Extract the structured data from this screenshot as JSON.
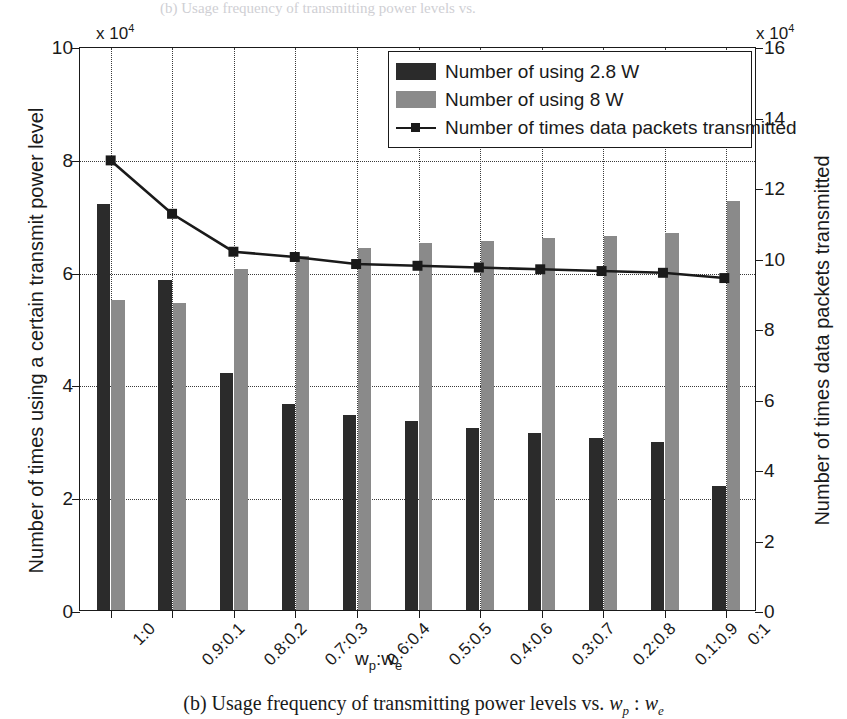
{
  "caption": {
    "prefix": "(b) Usage frequency of transmitting power levels vs. ",
    "wp": "w",
    "wp_sub": "p",
    "sep": " : ",
    "we": "w",
    "we_sub": "e"
  },
  "ghost_top_text": "(b) Usage frequency of transmitting power levels vs.",
  "axes": {
    "left": {
      "title": "Number of times using a certain transmit power level",
      "multiplier_text": "x 10",
      "multiplier_exp": "4",
      "ticks": [
        "0",
        "2",
        "4",
        "6",
        "8",
        "10"
      ],
      "tick_values": [
        0,
        2,
        4,
        6,
        8,
        10
      ],
      "min": 0,
      "max": 10
    },
    "right": {
      "title": "Number of times data packets transmitted",
      "multiplier_text": "x 10",
      "multiplier_exp": "4",
      "ticks": [
        "0",
        "2",
        "4",
        "6",
        "8",
        "10",
        "12",
        "14",
        "16"
      ],
      "tick_values": [
        0,
        2,
        4,
        6,
        8,
        10,
        12,
        14,
        16
      ],
      "min": 0,
      "max": 16
    },
    "x": {
      "title_main": "w",
      "title_sub1": "p",
      "title_colon": ":w",
      "title_sub2": "e"
    }
  },
  "legend": {
    "items": [
      {
        "label": "Number of using 2.8 W",
        "marker": "swatch-dark",
        "color": "#2b2b2b"
      },
      {
        "label": "Number of using 8 W",
        "marker": "swatch-light",
        "color": "#8a8a8a"
      },
      {
        "label": "Number of times data packets transmitted",
        "marker": "line-square",
        "color": "#1a1a1a"
      }
    ]
  },
  "chart_data": {
    "type": "bar",
    "title": "",
    "subtitle": "",
    "xlabel": "w_p:w_e",
    "ylabel": "Number of times using a certain transmit power level",
    "y2label": "Number of times data packets transmitted",
    "ylim": [
      0,
      10
    ],
    "y2lim": [
      0,
      16
    ],
    "y_scale_multiplier": 10000,
    "y2_scale_multiplier": 10000,
    "grid": true,
    "legend_position": "top-right",
    "categories": [
      "1:0",
      "0.9:0.1",
      "0.8:0.2",
      "0.7:0.3",
      "0.6:0.4",
      "0.5:0.5",
      "0.4:0.6",
      "0.3:0.7",
      "0.2:0.8",
      "0.1:0.9",
      "0:1"
    ],
    "series": [
      {
        "name": "Number of using 2.8 W",
        "type": "bar",
        "axis": "left",
        "color": "#2b2b2b",
        "values": [
          7.2,
          5.85,
          4.2,
          3.65,
          3.45,
          3.35,
          3.22,
          3.13,
          3.05,
          2.98,
          2.2
        ]
      },
      {
        "name": "Number of using 8 W",
        "type": "bar",
        "axis": "left",
        "color": "#8a8a8a",
        "values": [
          5.5,
          5.45,
          6.05,
          6.28,
          6.42,
          6.5,
          6.55,
          6.6,
          6.63,
          6.68,
          7.25
        ]
      },
      {
        "name": "Number of times data packets transmitted",
        "type": "line",
        "axis": "right",
        "color": "#1a1a1a",
        "marker": "square",
        "values": [
          12.8,
          11.28,
          10.2,
          10.05,
          9.85,
          9.8,
          9.75,
          9.7,
          9.65,
          9.6,
          9.45
        ]
      }
    ]
  }
}
